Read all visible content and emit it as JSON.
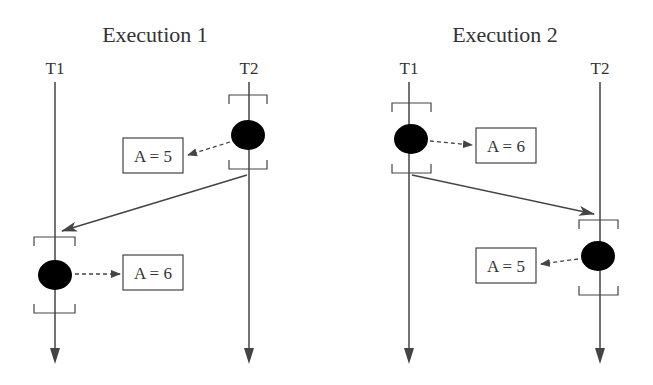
{
  "diagram": {
    "type": "thread-execution-timeline",
    "executions": [
      {
        "title": "Execution 1",
        "threads": [
          {
            "label": "T1",
            "event": {
              "value_label": "A = 6"
            }
          },
          {
            "label": "T2",
            "event": {
              "value_label": "A = 5"
            }
          }
        ],
        "order": "T2 writes A = 5 first, then T1 writes A = 6"
      },
      {
        "title": "Execution 2",
        "threads": [
          {
            "label": "T1",
            "event": {
              "value_label": "A = 6"
            }
          },
          {
            "label": "T2",
            "event": {
              "value_label": "A = 5"
            }
          }
        ],
        "order": "T1 writes A = 6 first, then T2 writes A = 5"
      }
    ]
  },
  "colors": {
    "line": "#444444",
    "event": "#000000",
    "text": "#333333",
    "background": "#ffffff"
  }
}
